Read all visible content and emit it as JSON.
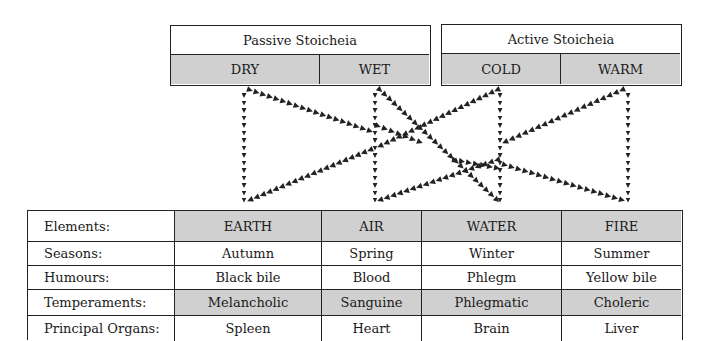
{
  "stoicheia": {
    "passive": {
      "title": "Passive Stoicheia",
      "qualities": [
        "DRY",
        "WET"
      ]
    },
    "active": {
      "title": "Active Stoicheia",
      "qualities": [
        "COLD",
        "WARM"
      ]
    }
  },
  "connections": [
    {
      "from": "DRY",
      "to": "EARTH"
    },
    {
      "from": "DRY",
      "to": "AIR"
    },
    {
      "from": "WET",
      "to": "AIR"
    },
    {
      "from": "WET",
      "to": "EARTH"
    },
    {
      "from": "WET",
      "to": "WATER"
    },
    {
      "from": "COLD",
      "to": "WATER"
    },
    {
      "from": "COLD",
      "to": "EARTH"
    },
    {
      "from": "WARM",
      "to": "FIRE"
    },
    {
      "from": "WARM",
      "to": "AIR"
    },
    {
      "from": "COLD",
      "to": "FIRE"
    }
  ],
  "table": {
    "rows": [
      {
        "label": "Elements:",
        "values": [
          "EARTH",
          "AIR",
          "WATER",
          "FIRE"
        ],
        "shaded": true
      },
      {
        "label": "Seasons:",
        "values": [
          "Autumn",
          "Spring",
          "Winter",
          "Summer"
        ],
        "shaded": false
      },
      {
        "label": "Humours:",
        "values": [
          "Black bile",
          "Blood",
          "Phlegm",
          "Yellow bile"
        ],
        "shaded": false
      },
      {
        "label": "Temperaments:",
        "values": [
          "Melancholic",
          "Sanguine",
          "Phlegmatic",
          "Choleric"
        ],
        "shaded": true
      },
      {
        "label": "Principal Organs:",
        "values": [
          "Spleen",
          "Heart",
          "Brain",
          "Liver"
        ],
        "shaded": false
      }
    ]
  },
  "colors": {
    "shade": "#d0d0d0",
    "line": "#222222"
  }
}
